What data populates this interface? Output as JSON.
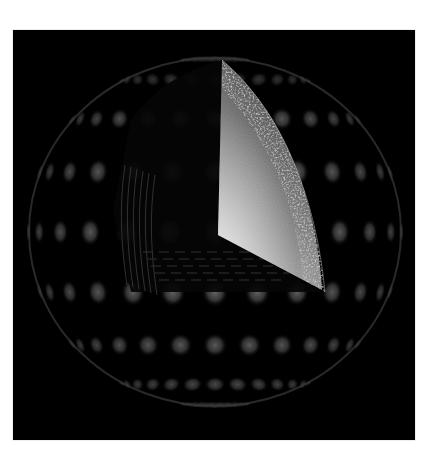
{
  "figure": {
    "alt_text": "Sphere with grid of glowing lobes and a cut-open wedge revealing a bright gradient interior face and noisy shell",
    "colors": {
      "background": "#000000",
      "frame": "#ffffff",
      "lobe": "#6a6a6a",
      "wedge_light": "#d8d8d8",
      "wedge_dark": "#3a3a3a",
      "noise_rim": "#8c8c8c"
    },
    "sphere": {
      "center": [
        202,
        202
      ],
      "radius_x": 188,
      "radius_y": 176,
      "lobe_rows": 8,
      "lobe_cols": 11
    },
    "cutaway": {
      "apex": [
        209,
        30
      ],
      "corner": [
        205,
        205
      ],
      "bottom": [
        309,
        260
      ]
    }
  }
}
